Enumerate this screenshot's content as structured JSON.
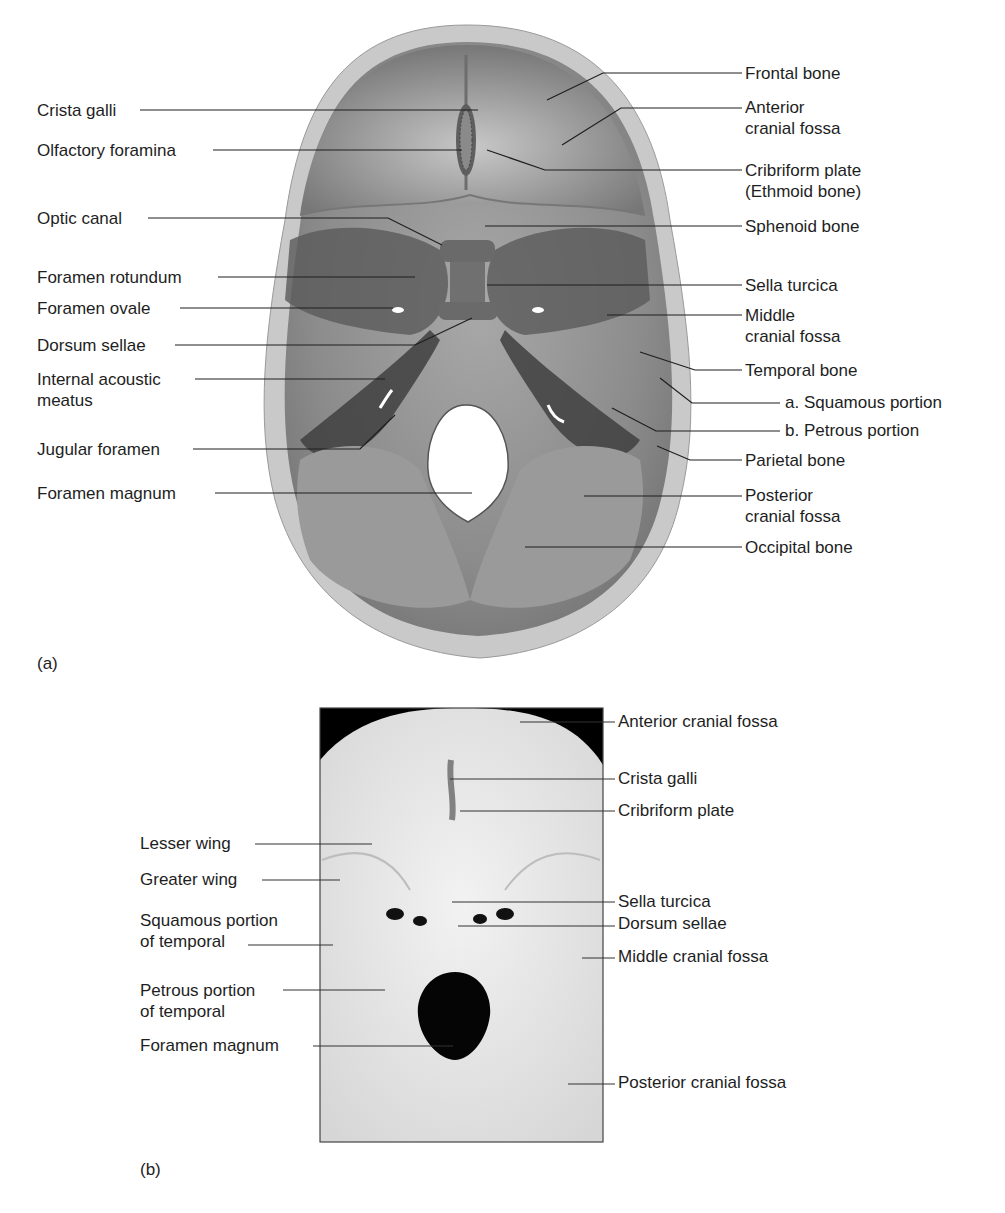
{
  "figure_a": {
    "panel_label": "(a)",
    "left_labels": [
      {
        "text": "Crista galli",
        "x": 37,
        "y": 105
      },
      {
        "text": "Olfactory foramina",
        "x": 37,
        "y": 141
      },
      {
        "text": "Optic canal",
        "x": 37,
        "y": 209
      },
      {
        "text": "Foramen rotundum",
        "x": 37,
        "y": 268
      },
      {
        "text": "Foramen ovale",
        "x": 37,
        "y": 299
      },
      {
        "text": "Dorsum sellae",
        "x": 37,
        "y": 336
      },
      {
        "text": "Internal acoustic\nmeatus",
        "x": 37,
        "y": 370
      },
      {
        "text": "Jugular foramen",
        "x": 37,
        "y": 440
      },
      {
        "text": "Foramen magnum",
        "x": 37,
        "y": 485
      }
    ],
    "right_labels": [
      {
        "text": "Frontal bone",
        "x": 745,
        "y": 64
      },
      {
        "text": "Anterior\ncranial fossa",
        "x": 745,
        "y": 97
      },
      {
        "text": "Cribriform plate\n(Ethmoid bone)",
        "x": 745,
        "y": 162
      },
      {
        "text": "Sphenoid bone",
        "x": 745,
        "y": 219
      },
      {
        "text": "Sella turcica",
        "x": 745,
        "y": 278
      },
      {
        "text": "Middle\ncranial fossa",
        "x": 745,
        "y": 308
      },
      {
        "text": "Temporal bone",
        "x": 745,
        "y": 363
      },
      {
        "text": "a. Squamous portion",
        "x": 785,
        "y": 393
      },
      {
        "text": "b. Petrous portion",
        "x": 785,
        "y": 422
      },
      {
        "text": "Parietal bone",
        "x": 745,
        "y": 452
      },
      {
        "text": "Posterior\ncranial fossa",
        "x": 745,
        "y": 487
      },
      {
        "text": "Occipital bone",
        "x": 745,
        "y": 539
      }
    ]
  },
  "figure_b": {
    "panel_label": "(b)",
    "left_labels": [
      {
        "text": "Lesser wing",
        "x": 140,
        "y": 834
      },
      {
        "text": "Greater wing",
        "x": 140,
        "y": 870
      },
      {
        "text": "Squamous portion\nof temporal",
        "x": 140,
        "y": 909
      },
      {
        "text": "Petrous portion\nof temporal",
        "x": 140,
        "y": 980
      },
      {
        "text": "Foramen magnum",
        "x": 140,
        "y": 1041
      }
    ],
    "right_labels": [
      {
        "text": "Anterior cranial fossa",
        "x": 618,
        "y": 711
      },
      {
        "text": "Crista galli",
        "x": 618,
        "y": 768
      },
      {
        "text": "Cribriform plate",
        "x": 618,
        "y": 801
      },
      {
        "text": "Sella turcica",
        "x": 618,
        "y": 892
      },
      {
        "text": "Dorsum sellae",
        "x": 618,
        "y": 914
      },
      {
        "text": "Middle cranial fossa",
        "x": 618,
        "y": 947
      },
      {
        "text": "Posterior cranial fossa",
        "x": 618,
        "y": 1073
      }
    ]
  }
}
